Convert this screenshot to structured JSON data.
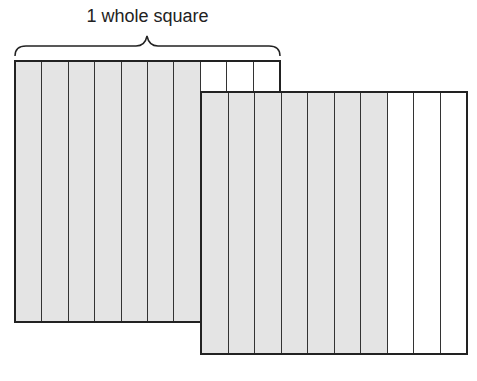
{
  "label": "1 whole square",
  "squares": [
    {
      "name": "square-1",
      "columns": 10,
      "shaded": 7
    },
    {
      "name": "square-2",
      "columns": 10,
      "shaded": 7
    }
  ],
  "colors": {
    "shaded": "#e4e4e4",
    "unshaded": "#ffffff",
    "line": "#222222"
  }
}
